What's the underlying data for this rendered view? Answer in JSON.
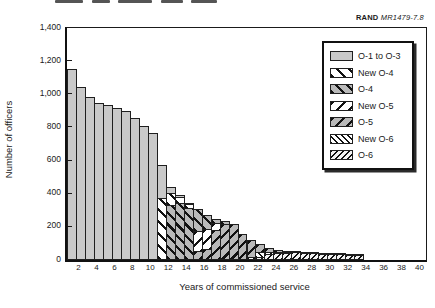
{
  "header": {
    "brand": "RAND",
    "doc_id": "MR1479-7.8"
  },
  "axes": {
    "ylabel": "Number of officers",
    "xlabel": "Years of commissioned service"
  },
  "legend": {
    "entries": [
      {
        "label": "O-1 to O-3",
        "pattern": "solid-gray"
      },
      {
        "label": "New O-4",
        "pattern": "bold-backslash-white"
      },
      {
        "label": "O-4",
        "pattern": "bold-backslash-gray"
      },
      {
        "label": "New O-5",
        "pattern": "bold-slash-white"
      },
      {
        "label": "O-5",
        "pattern": "bold-slash-gray"
      },
      {
        "label": "New O-6",
        "pattern": "fine-backslash-white"
      },
      {
        "label": "O-6",
        "pattern": "fine-slash-white"
      }
    ]
  },
  "colors": {
    "bar_gray": "#c9c9c9",
    "hatch_gray": "#b9b9b9",
    "ink": "#1a1a1a"
  },
  "chart_data": {
    "type": "bar",
    "stacked": true,
    "title": "",
    "xlabel": "Years of commissioned service",
    "ylabel": "Number of officers",
    "ylim": [
      0,
      1400
    ],
    "ytick_step": 200,
    "ytick_labels": [
      "0",
      "200",
      "400",
      "600",
      "800",
      "1,000",
      "1,200",
      "1,400"
    ],
    "xtick_labels": [
      2,
      4,
      6,
      8,
      10,
      12,
      14,
      16,
      18,
      20,
      22,
      24,
      26,
      28,
      30,
      32,
      34,
      36,
      38,
      40
    ],
    "x_years": [
      1,
      2,
      3,
      4,
      5,
      6,
      7,
      8,
      9,
      10,
      11,
      12,
      13,
      14,
      15,
      16,
      17,
      18,
      19,
      20,
      21,
      22,
      23,
      24,
      25,
      26,
      27,
      28,
      29,
      30,
      31,
      32,
      33
    ],
    "x_range_shown": [
      1,
      40
    ],
    "grid": false,
    "legend_position": "upper right",
    "stack_order_bottom_to_top": [
      "O-6",
      "New O-6",
      "O-5",
      "New O-5",
      "O-4",
      "New O-4",
      "O-1 to O-3"
    ],
    "series": [
      {
        "name": "O-1 to O-3",
        "pattern": "solid-gray",
        "values": [
          1150,
          1045,
          985,
          950,
          935,
          920,
          900,
          860,
          810,
          765,
          200,
          35,
          10,
          5,
          0,
          0,
          0,
          0,
          0,
          0,
          0,
          0,
          0,
          0,
          0,
          0,
          0,
          0,
          0,
          0,
          0,
          0,
          0
        ]
      },
      {
        "name": "New O-4",
        "pattern": "bold-backslash-white",
        "values": [
          0,
          0,
          0,
          0,
          0,
          0,
          0,
          0,
          0,
          0,
          375,
          75,
          35,
          25,
          0,
          0,
          0,
          0,
          0,
          0,
          0,
          0,
          0,
          0,
          0,
          0,
          0,
          0,
          0,
          0,
          0,
          0,
          0
        ]
      },
      {
        "name": "O-4",
        "pattern": "bold-backslash-gray",
        "values": [
          0,
          0,
          0,
          0,
          0,
          0,
          0,
          0,
          0,
          0,
          0,
          330,
          345,
          315,
          130,
          85,
          25,
          15,
          0,
          0,
          0,
          0,
          0,
          0,
          0,
          0,
          0,
          0,
          0,
          0,
          0,
          0,
          0
        ]
      },
      {
        "name": "New O-5",
        "pattern": "bold-slash-white",
        "values": [
          0,
          0,
          0,
          0,
          0,
          0,
          0,
          0,
          0,
          0,
          0,
          0,
          0,
          0,
          120,
          120,
          45,
          0,
          0,
          0,
          0,
          0,
          0,
          0,
          0,
          0,
          0,
          0,
          0,
          0,
          0,
          0,
          0
        ]
      },
      {
        "name": "O-5",
        "pattern": "bold-slash-gray",
        "values": [
          0,
          0,
          0,
          0,
          0,
          0,
          0,
          0,
          0,
          0,
          0,
          0,
          0,
          0,
          55,
          65,
          180,
          220,
          215,
          155,
          100,
          45,
          25,
          12,
          8,
          5,
          5,
          4,
          3,
          3,
          3,
          3,
          3
        ]
      },
      {
        "name": "New O-6",
        "pattern": "fine-backslash-white",
        "values": [
          0,
          0,
          0,
          0,
          0,
          0,
          0,
          0,
          0,
          0,
          0,
          0,
          0,
          0,
          0,
          0,
          0,
          0,
          0,
          0,
          20,
          30,
          15,
          8,
          5,
          0,
          0,
          0,
          0,
          0,
          0,
          0,
          0
        ]
      },
      {
        "name": "O-6",
        "pattern": "fine-slash-white",
        "values": [
          0,
          0,
          0,
          0,
          0,
          0,
          0,
          0,
          0,
          0,
          0,
          0,
          0,
          0,
          0,
          0,
          0,
          0,
          0,
          0,
          0,
          20,
          35,
          42,
          42,
          47,
          45,
          41,
          39,
          37,
          35,
          33,
          32
        ]
      }
    ]
  }
}
